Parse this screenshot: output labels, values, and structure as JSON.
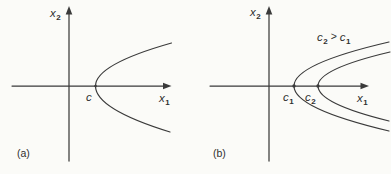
{
  "figure": {
    "background": "#fbfbf8",
    "ink": "#3a3a3a",
    "panels": [
      {
        "caption": "(a)",
        "axes": {
          "y_label": {
            "base": "x",
            "sub": "2"
          },
          "x_label": {
            "base": "x",
            "sub": "1"
          }
        },
        "curves": [
          {
            "name": "parabola-c",
            "opens": "right",
            "vertex_label": {
              "base": "c",
              "sub": ""
            }
          }
        ]
      },
      {
        "caption": "(b)",
        "axes": {
          "y_label": {
            "base": "x",
            "sub": "2"
          },
          "x_label": {
            "base": "x",
            "sub": "1"
          }
        },
        "curves": [
          {
            "name": "parabola-c1",
            "opens": "right",
            "vertex_label": {
              "base": "c",
              "sub": "1"
            }
          },
          {
            "name": "parabola-c2",
            "opens": "right",
            "vertex_label": {
              "base": "c",
              "sub": "2"
            }
          }
        ],
        "annotation": {
          "lhs_base": "c",
          "lhs_sub": "2",
          "op": ">",
          "rhs_base": "c",
          "rhs_sub": "1"
        }
      }
    ]
  }
}
